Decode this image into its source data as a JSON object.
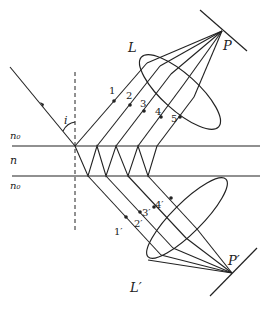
{
  "diagram": {
    "media": {
      "top": "n₀",
      "film": "n",
      "bottom": "n₀"
    },
    "angle_label": "i",
    "lenses": {
      "reflected": "L",
      "transmitted": "L′"
    },
    "focal_points": {
      "reflected": "P",
      "transmitted": "P′"
    },
    "reflected_rays": [
      "1",
      "2",
      "3",
      "4",
      "5"
    ],
    "transmitted_rays": [
      "1′",
      "2′",
      "3′",
      "4′"
    ],
    "colors": {
      "line": "#222222",
      "background": "#ffffff"
    }
  }
}
